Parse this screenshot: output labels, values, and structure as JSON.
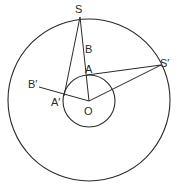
{
  "diagram": {
    "type": "geometry",
    "center": {
      "label": "O",
      "x": 89,
      "y": 101
    },
    "outer_circle": {
      "cx": 89,
      "cy": 100,
      "r": 81
    },
    "inner_circle": {
      "cx": 89,
      "cy": 100,
      "r": 26
    },
    "points": {
      "S": {
        "label": "S",
        "x": 80,
        "y": 17
      },
      "S2": {
        "label": "S′",
        "x": 161,
        "y": 65
      },
      "A": {
        "label": "A",
        "x": 87,
        "y": 75
      },
      "A2": {
        "label": "A′",
        "x": 64,
        "y": 96
      },
      "B": {
        "label": "B",
        "x": 84,
        "y": 48
      },
      "B2": {
        "label": "B′",
        "x": 39,
        "y": 87
      },
      "O": {
        "label": "O",
        "x": 89,
        "y": 101
      }
    },
    "segments": [
      [
        "S",
        "O"
      ],
      [
        "S",
        "A′"
      ],
      [
        "S′",
        "A"
      ],
      [
        "S′",
        "O"
      ],
      [
        "B′",
        "O"
      ]
    ],
    "stroke_color": "#2a2a2a",
    "caption": ""
  }
}
